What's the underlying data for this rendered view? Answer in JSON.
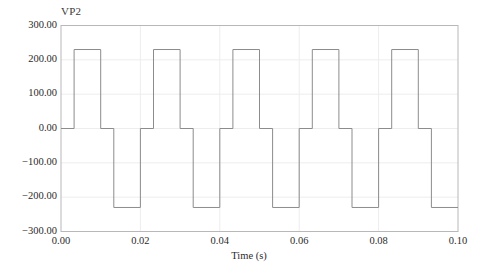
{
  "figure": {
    "series_label": "VP2",
    "background_color": "#ffffff",
    "frame_color": "#b8b8b8",
    "grid_color": "#ededed",
    "trace_color": "#8c8c8c"
  },
  "chart_data": {
    "type": "line",
    "title": "",
    "subtitle": "",
    "xlabel": "Time (s)",
    "ylabel": "",
    "series_name": "VP2",
    "legend_entries": [
      "VP2"
    ],
    "legend_position": "top-left-inside",
    "grid": true,
    "xlim": [
      0.0,
      0.1
    ],
    "ylim": [
      -300.0,
      300.0
    ],
    "xticks": [
      0.0,
      0.02,
      0.04,
      0.06,
      0.08,
      0.1
    ],
    "xtick_labels": [
      "0.00",
      "0.02",
      "0.04",
      "0.06",
      "0.08",
      "0.10"
    ],
    "yticks": [
      -300.0,
      -200.0,
      -100.0,
      0.0,
      100.0,
      200.0,
      300.0
    ],
    "ytick_labels": [
      "-300.00",
      "-200.00",
      "-100.00",
      "0.00",
      "100.00",
      "200.00",
      "300.00"
    ],
    "waveform": "quasi-square-wave",
    "amplitude": 230.0,
    "frequency_hz": 50,
    "period_s": 0.02,
    "cycles_shown": 5,
    "x": [
      0.0,
      0.0033,
      0.0033,
      0.01,
      0.01,
      0.0133,
      0.0133,
      0.02,
      0.02,
      0.0233,
      0.0233,
      0.03,
      0.03,
      0.0333,
      0.0333,
      0.04,
      0.04,
      0.0433,
      0.0433,
      0.05,
      0.05,
      0.0533,
      0.0533,
      0.06,
      0.06,
      0.0633,
      0.0633,
      0.07,
      0.07,
      0.0733,
      0.0733,
      0.08,
      0.08,
      0.0833,
      0.0833,
      0.09,
      0.09,
      0.0933,
      0.0933,
      0.1
    ],
    "y": [
      0,
      0,
      230,
      230,
      0,
      0,
      -230,
      -230,
      0,
      0,
      230,
      230,
      0,
      0,
      -230,
      -230,
      0,
      0,
      230,
      230,
      0,
      0,
      -230,
      -230,
      0,
      0,
      230,
      230,
      0,
      0,
      -230,
      -230,
      0,
      0,
      230,
      230,
      0,
      0,
      -230,
      -230
    ]
  }
}
